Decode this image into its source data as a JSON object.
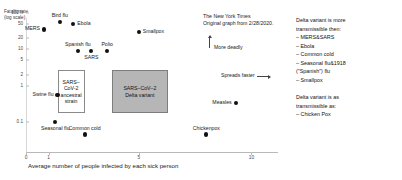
{
  "source": {
    "publication": "The New York Times",
    "note": "Original graph from 2/28/2020."
  },
  "annotations": {
    "more_deadly": "More deadly",
    "spreads_faster": "Spreads faster"
  },
  "legend": {
    "block1_heading_line1": "Delta variant is more",
    "block1_heading_line2": "transmissible then:",
    "block1_items": [
      "– MERS&SARS",
      "– Ebola",
      "– Common cold",
      "– Seasonal flu&1918",
      "(\"Spanish\") flu",
      "– Smallpox"
    ],
    "block2_heading_line1": "Delta variant is as",
    "block2_heading_line2": "transmissible as:",
    "block2_items": [
      "– Chicken Pox"
    ]
  },
  "boxes": {
    "ancestral_line1": "SARS–",
    "ancestral_line2": "CoV-2",
    "ancestral_line3": "ancestral",
    "ancestral_line4": "strain",
    "delta_line1": "SARS–CoV–2",
    "delta_line2": "Delta variant"
  },
  "chart_data": {
    "type": "scatter",
    "title": "",
    "xlabel": "Average number of people infected by each sick person",
    "ylabel": "Fatality rate",
    "ylabel_note": "(log scale)",
    "yscale": "log",
    "ylim": [
      0.1,
      100
    ],
    "xlim": [
      0,
      11
    ],
    "grid": false,
    "legend_position": "right",
    "yticks": [
      "100%",
      "50",
      "20",
      "10",
      "5",
      "2",
      "1",
      "0.1"
    ],
    "ytick_values": [
      100,
      50,
      20,
      10,
      5,
      2,
      1,
      0.1
    ],
    "xticks": [
      "0",
      "1",
      "5",
      "10"
    ],
    "xtick_values": [
      0,
      1,
      5,
      10
    ],
    "points": [
      {
        "label": "MERS",
        "x": 0.8,
        "y": 35,
        "label_pos": "left"
      },
      {
        "label": "Bird flu",
        "x": 1.5,
        "y": 55,
        "label_pos": "above"
      },
      {
        "label": "Ebola",
        "x": 2.1,
        "y": 50,
        "label_pos": "right"
      },
      {
        "label": "Smallpox",
        "x": 5.0,
        "y": 30,
        "label_pos": "right"
      },
      {
        "label": "Spanish flu",
        "x": 2.3,
        "y": 9,
        "label_pos": "above"
      },
      {
        "label": "SARS",
        "x": 2.9,
        "y": 9,
        "label_pos": "below"
      },
      {
        "label": "Polio",
        "x": 3.6,
        "y": 9,
        "label_pos": "above"
      },
      {
        "label": "Swine flu",
        "x": 1.4,
        "y": 0.55,
        "label_pos": "left"
      },
      {
        "label": "Seasonal flu",
        "x": 1.3,
        "y": 0.1,
        "label_pos": "below"
      },
      {
        "label": "Common cold",
        "x": 2.6,
        "y": 0.045,
        "label_pos": "above"
      },
      {
        "label": "Chickenpox",
        "x": 8.0,
        "y": 0.045,
        "label_pos": "above"
      },
      {
        "label": "Measles",
        "x": 9.3,
        "y": 0.33,
        "label_pos": "left"
      }
    ],
    "highlight_regions": [
      {
        "label": "SARS-CoV-2 ancestral strain",
        "x_range": [
          1.4,
          2.6
        ],
        "y_range": [
          0.18,
          2.6
        ]
      },
      {
        "label": "SARS-CoV-2 Delta variant",
        "x_range": [
          3.8,
          6.3
        ],
        "y_range": [
          0.18,
          2.6
        ]
      }
    ]
  }
}
